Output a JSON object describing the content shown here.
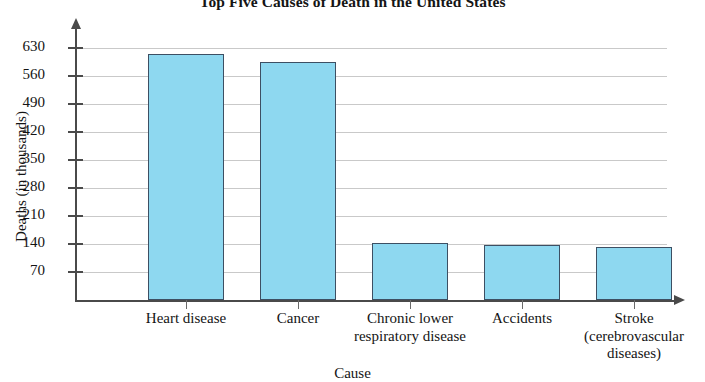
{
  "chart_data": {
    "type": "bar",
    "title": "Top Five Causes of Death in the United States",
    "xlabel": "Cause",
    "ylabel": "Deaths (in thousands)",
    "categories": [
      "Heart disease",
      "Chronic lower\nrespiratory disease",
      "Cancer",
      "Accidents",
      "Stroke\n(cerebrovascular\ndiseases)"
    ],
    "category_lines": [
      [
        "Heart disease"
      ],
      [
        "Cancer"
      ],
      [
        "Chronic lower",
        "respiratory disease"
      ],
      [
        "Accidents"
      ],
      [
        "Stroke",
        "(cerebrovascular",
        "diseases)"
      ]
    ],
    "bars": [
      {
        "label": "Heart disease",
        "value": 616
      },
      {
        "label": "Cancer",
        "value": 596
      },
      {
        "label": "Chronic lower respiratory disease",
        "value": 143
      },
      {
        "label": "Accidents",
        "value": 137
      },
      {
        "label": "Stroke (cerebrovascular diseases)",
        "value": 133
      }
    ],
    "values": [
      616,
      596,
      143,
      137,
      133
    ],
    "ylim": [
      0,
      700
    ],
    "yticks": [
      70,
      140,
      210,
      280,
      350,
      420,
      490,
      560,
      630
    ],
    "ytick_labels": [
      "70",
      "140",
      "210",
      "280",
      "350",
      "420",
      "490",
      "560",
      "630"
    ],
    "grid": true,
    "legend": "none",
    "bar_color": "#8ed8f0",
    "bar_border_color": "#3d4f63",
    "axis_color": "#4a4a4a",
    "grid_color": "#c9c9c9"
  }
}
